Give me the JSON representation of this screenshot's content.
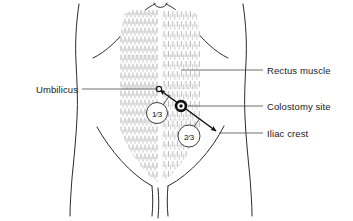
{
  "figure": {
    "background_color": "#ffffff",
    "line_color": "#2b2b2b",
    "leader_color": "#4a4a4a",
    "text_color": "#1a1a1a"
  },
  "labels": {
    "umbilicus": "Umbilicus",
    "rectus_muscle": "Rectus muscle",
    "colostomy_site": "Colostomy site",
    "iliac_crest": "Iliac crest"
  },
  "markers": {
    "umbilicus_point": "umbilicus-marker",
    "colostomy_point": "colostomy-marker",
    "iliac_point": "iliac-crest-arrow"
  },
  "measurements": [
    {
      "id": "upper-third",
      "label": "1⁄3",
      "numerator": "1",
      "denominator": "3"
    },
    {
      "id": "lower-two-thirds",
      "label": "2⁄3",
      "numerator": "2",
      "denominator": "3"
    }
  ],
  "anatomy": {
    "rectus_left": "left-rectus-muscle",
    "rectus_right": "right-rectus-muscle",
    "costal_margin": "costal-margin",
    "pelvic_brim": "pelvic-brim",
    "torso_left": "torso-left-flank",
    "torso_right": "torso-right-flank"
  }
}
